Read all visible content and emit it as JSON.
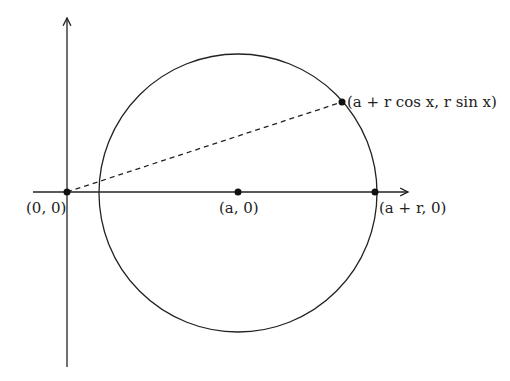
{
  "diagram": {
    "colors": {
      "stroke": "#222222",
      "background": "#ffffff"
    },
    "geometry": {
      "origin": [
        67,
        192
      ],
      "center": [
        238,
        192
      ],
      "radius": 138,
      "point_on_circle": [
        342,
        102
      ],
      "rightmost_point": [
        375,
        192
      ]
    },
    "labels": {
      "origin": "(0, 0)",
      "center": "(a, 0)",
      "right_point": "(a + r, 0)",
      "circle_point": "(a + r cos x, r sin x)"
    }
  }
}
